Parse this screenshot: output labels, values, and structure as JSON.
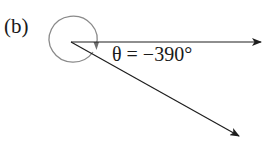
{
  "figure": {
    "panel_label": "(b)",
    "angle_label": "θ = −390°",
    "angle_degrees": -390,
    "colors": {
      "rays": "#1e1e1e",
      "circle": "#8a8a8a",
      "text": "#1a1a1a",
      "background": "#ffffff"
    },
    "elements": [
      {
        "name": "initial-side-ray",
        "description": "horizontal ray pointing right"
      },
      {
        "name": "terminal-side-ray",
        "description": "ray pointing down-right at -30°"
      },
      {
        "name": "rotation-circle",
        "description": "full clockwise rotation arc with arrowhead"
      }
    ]
  }
}
